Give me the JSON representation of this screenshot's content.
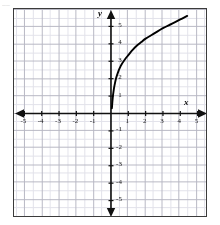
{
  "artifact": {
    "top_left_mark": "▁▁"
  },
  "axes": {
    "x_label": "x",
    "y_label": "y",
    "x_ticks": [
      "-5",
      "-4",
      "-3",
      "-2",
      "-1",
      "1",
      "2",
      "3",
      "4",
      "5"
    ],
    "y_ticks": [
      "5",
      "4",
      "3",
      "2",
      "1",
      "-1",
      "-2",
      "-3",
      "-4",
      "-5"
    ]
  },
  "colors": {
    "curve": "#000000",
    "axis": "#111111",
    "grid_major": "#b8b8c4",
    "grid_minor": "#e2e2ea",
    "frame": "#3b3b3b",
    "background": "#ffffff"
  },
  "chart_data": {
    "type": "line",
    "title": "",
    "xlabel": "x",
    "ylabel": "y",
    "xlim": [
      -5.6,
      5.6
    ],
    "ylim": [
      -6.0,
      6.0
    ],
    "grid": true,
    "grid_major_step": 1,
    "grid_minor_step": 0.5,
    "legend": "none",
    "series": [
      {
        "name": "curve",
        "description": "increasing concave-down logarithmic-type curve rising steeply from just above the origin on the positive x side",
        "x": [
          0.05,
          0.1,
          0.15,
          0.2,
          0.3,
          0.4,
          0.5,
          0.6,
          0.8,
          1.0,
          1.25,
          1.5,
          1.75,
          2.0,
          2.5,
          3.0,
          3.5,
          4.0,
          4.4
        ],
        "y": [
          0.3,
          0.9,
          1.3,
          1.6,
          2.05,
          2.35,
          2.6,
          2.8,
          3.1,
          3.35,
          3.65,
          3.9,
          4.1,
          4.3,
          4.6,
          4.9,
          5.15,
          5.4,
          5.6
        ]
      }
    ]
  }
}
